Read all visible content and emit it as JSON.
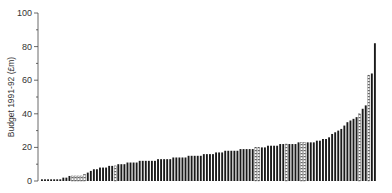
{
  "chart_data": {
    "type": "bar",
    "title": "",
    "xlabel": "",
    "ylabel": "Budget 1991-92 (£m)",
    "ylim": [
      0,
      100
    ],
    "yticks": [
      0,
      20,
      40,
      60,
      80,
      100
    ],
    "grid": false,
    "legend": null,
    "series": [
      {
        "name": "Budget",
        "values": [
          1,
          1,
          1,
          1,
          1,
          1,
          1,
          2,
          2,
          3,
          3,
          3,
          3,
          3,
          4,
          5,
          6,
          7,
          7,
          8,
          8,
          8,
          9,
          9,
          9,
          10,
          10,
          10,
          11,
          11,
          11,
          11,
          12,
          12,
          12,
          12,
          12,
          12,
          13,
          13,
          13,
          13,
          13,
          14,
          14,
          14,
          14,
          14,
          15,
          15,
          15,
          15,
          15,
          16,
          16,
          16,
          16,
          17,
          17,
          17,
          18,
          18,
          18,
          18,
          18,
          19,
          19,
          19,
          19,
          19,
          20,
          20,
          20,
          20,
          21,
          21,
          21,
          21,
          22,
          22,
          22,
          22,
          22,
          22,
          23,
          23,
          23,
          23,
          23,
          23,
          24,
          24,
          25,
          25,
          26,
          28,
          29,
          30,
          31,
          33,
          35,
          36,
          37,
          38,
          40,
          43,
          45,
          63,
          64,
          82
        ],
        "hatched_indices": [
          10,
          11,
          12,
          13,
          14,
          24,
          70,
          71,
          80,
          85,
          86,
          104,
          107
        ]
      }
    ]
  },
  "axis": {
    "y_title": "Budget 1991-92 (£m)",
    "tick_labels": [
      "0",
      "20",
      "40",
      "60",
      "80",
      "100"
    ]
  }
}
